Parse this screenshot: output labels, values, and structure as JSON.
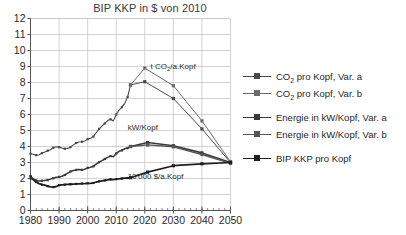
{
  "chart_data": {
    "type": "line",
    "title": "BIP KKP in $ von 2010",
    "xlabel": "",
    "ylabel": "",
    "xlim": [
      1980,
      2050
    ],
    "ylim": [
      0,
      12
    ],
    "grid": true,
    "legend_position": "right",
    "xticks": [
      "1980",
      "1990",
      "2000",
      "2010",
      "2020",
      "2030",
      "2040",
      "2050"
    ],
    "xtick_values": [
      1980,
      1990,
      2000,
      2010,
      2020,
      2030,
      2040,
      2050
    ],
    "yticks": [
      "0",
      "1",
      "2",
      "3",
      "4",
      "5",
      "6",
      "7",
      "8",
      "9",
      "10",
      "11",
      "12"
    ],
    "ytick_values": [
      0,
      1,
      2,
      3,
      4,
      5,
      6,
      7,
      8,
      9,
      10,
      11,
      12
    ],
    "annotations": [
      {
        "text": "t CO",
        "sub": "2",
        "text2": "/a.Kopf",
        "x": 2022,
        "y": 8.85,
        "name": "annotation-co2"
      },
      {
        "text": "kW/Kopf",
        "x": 2014,
        "y": 5.05,
        "name": "annotation-kw"
      },
      {
        "text": "10'000 $/a.Kopf",
        "x": 2014,
        "y": 2.0,
        "name": "annotation-bip"
      }
    ],
    "series": [
      {
        "name": "CO2 pro Kopf, Var. a",
        "color": "#4a4a4a",
        "width": 1.0,
        "markers": true,
        "x": [
          2015,
          2020,
          2030,
          2040,
          2050
        ],
        "y": [
          7.85,
          8.05,
          7.0,
          5.1,
          3.0
        ]
      },
      {
        "name": "CO2 pro Kopf, Var. b",
        "color": "#6b6b6b",
        "width": 1.0,
        "markers": true,
        "x": [
          2015,
          2020,
          2030,
          2040,
          2050
        ],
        "y": [
          7.85,
          8.9,
          7.8,
          5.6,
          3.05
        ]
      },
      {
        "name": "Energie in kW/Kopf, Var. a",
        "color": "#3a3a3a",
        "width": 1.6,
        "markers": true,
        "x": [
          2015,
          2021,
          2030,
          2040,
          2050
        ],
        "y": [
          4.0,
          4.25,
          4.05,
          3.6,
          3.0
        ]
      },
      {
        "name": "Energie in kW/Kopf, Var. b",
        "color": "#555555",
        "width": 1.4,
        "markers": true,
        "x": [
          2015,
          2021,
          2030,
          2040,
          2050
        ],
        "y": [
          4.0,
          4.1,
          3.98,
          3.5,
          2.95
        ]
      },
      {
        "name": "BIP KKP pro Kopf",
        "color": "#1f1f1f",
        "width": 1.7,
        "markers": true,
        "x": [
          2015,
          2021,
          2030,
          2040,
          2050
        ],
        "y": [
          2.05,
          2.4,
          2.8,
          2.92,
          3.0
        ]
      }
    ],
    "history": [
      {
        "name": "CO2 pro Kopf, historisch",
        "color": "#4a4a4a",
        "width": 1.1,
        "x": [
          1980,
          1981,
          1982,
          1983,
          1984,
          1985,
          1986,
          1987,
          1988,
          1989,
          1990,
          1991,
          1992,
          1993,
          1994,
          1995,
          1996,
          1997,
          1998,
          1999,
          2000,
          2001,
          2002,
          2003,
          2004,
          2005,
          2006,
          2007,
          2008,
          2009,
          2010,
          2011,
          2012,
          2013,
          2014,
          2015
        ],
        "y": [
          3.55,
          3.52,
          3.46,
          3.48,
          3.58,
          3.66,
          3.74,
          3.8,
          3.92,
          3.98,
          3.96,
          3.9,
          3.86,
          3.88,
          3.96,
          4.1,
          4.22,
          4.28,
          4.3,
          4.34,
          4.46,
          4.52,
          4.62,
          4.86,
          5.1,
          5.28,
          5.44,
          5.62,
          5.7,
          5.6,
          6.0,
          6.28,
          6.46,
          6.7,
          7.1,
          7.85
        ]
      },
      {
        "name": "Energie in kW/Kopf, historisch",
        "color": "#3a3a3a",
        "width": 1.5,
        "x": [
          1980,
          1981,
          1982,
          1983,
          1984,
          1985,
          1986,
          1987,
          1988,
          1989,
          1990,
          1991,
          1992,
          1993,
          1994,
          1995,
          1996,
          1997,
          1998,
          1999,
          2000,
          2001,
          2002,
          2003,
          2004,
          2005,
          2006,
          2007,
          2008,
          2009,
          2010,
          2011,
          2012,
          2013,
          2014,
          2015
        ],
        "y": [
          2.0,
          1.95,
          1.88,
          1.84,
          1.86,
          1.88,
          1.9,
          1.96,
          2.02,
          2.08,
          2.1,
          2.14,
          2.22,
          2.34,
          2.44,
          2.5,
          2.54,
          2.56,
          2.54,
          2.58,
          2.66,
          2.7,
          2.76,
          2.9,
          3.02,
          3.12,
          3.22,
          3.32,
          3.4,
          3.36,
          3.56,
          3.7,
          3.76,
          3.86,
          3.9,
          4.0
        ]
      },
      {
        "name": "BIP KKP pro Kopf, historisch",
        "color": "#1f1f1f",
        "width": 1.8,
        "x": [
          1980,
          1981,
          1982,
          1983,
          1984,
          1985,
          1986,
          1987,
          1988,
          1989,
          1990,
          1991,
          1992,
          1993,
          1994,
          1995,
          1996,
          1997,
          1998,
          1999,
          2000,
          2001,
          2002,
          2003,
          2004,
          2005,
          2006,
          2007,
          2008,
          2009,
          2010,
          2011,
          2012,
          2013,
          2014,
          2015
        ],
        "y": [
          2.15,
          1.92,
          1.78,
          1.68,
          1.62,
          1.58,
          1.52,
          1.48,
          1.46,
          1.5,
          1.58,
          1.6,
          1.62,
          1.63,
          1.64,
          1.65,
          1.66,
          1.67,
          1.68,
          1.68,
          1.7,
          1.7,
          1.72,
          1.78,
          1.82,
          1.85,
          1.88,
          1.92,
          1.95,
          1.93,
          1.96,
          1.98,
          2.0,
          2.02,
          2.03,
          2.05
        ]
      }
    ]
  },
  "legend": {
    "items": [
      {
        "label_pre": "CO",
        "label_sub": "2",
        "label_post": " pro Kopf, Var. a",
        "color": "#4a4a4a",
        "gap": false,
        "name": "legend-item-co2-var-a"
      },
      {
        "label_pre": "CO",
        "label_sub": "2",
        "label_post": " pro Kopf, Var. b",
        "color": "#6b6b6b",
        "gap": false,
        "name": "legend-item-co2-var-b"
      },
      {
        "label_pre": "Energie in kW/Kopf, Var. a",
        "label_sub": "",
        "label_post": "",
        "color": "#3a3a3a",
        "gap": true,
        "name": "legend-item-energie-var-a"
      },
      {
        "label_pre": "Energie in kW/Kopf, Var. b",
        "label_sub": "",
        "label_post": "",
        "color": "#555555",
        "gap": false,
        "name": "legend-item-energie-var-b"
      },
      {
        "label_pre": "BIP KKP pro Kopf",
        "label_sub": "",
        "label_post": "",
        "color": "#1f1f1f",
        "gap": true,
        "name": "legend-item-bip-kkp"
      }
    ]
  },
  "axes": {
    "color": "#555555",
    "grid_color": "#c8c8c8"
  }
}
